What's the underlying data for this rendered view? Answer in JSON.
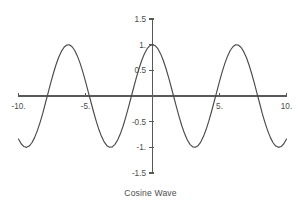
{
  "figure": {
    "caption": "Cosine Wave",
    "background_color": "#ffffff",
    "curve_color": "#4a4a4a",
    "axis_color": "#58595b",
    "text_color": "#4d4d4d"
  },
  "chart_data": {
    "type": "line",
    "title": "",
    "caption": "Cosine Wave",
    "function": "cos(x)",
    "xlabel": "",
    "ylabel": "",
    "xlim": [
      -10,
      10
    ],
    "ylim": [
      -1.5,
      1.5
    ],
    "grid": false,
    "legend": false,
    "axes_style": "crossing-at-origin",
    "x_ticks": [
      -10,
      -5,
      5,
      10
    ],
    "x_tick_labels": [
      "-10.",
      "-5.",
      "5.",
      "10."
    ],
    "y_ticks": [
      1.5,
      1,
      0.5,
      -0.5,
      -1,
      -1.5
    ],
    "y_tick_labels": [
      "1.5",
      "1.",
      "0.5",
      "-0.5",
      "-1.",
      "-1.5"
    ],
    "series": [
      {
        "name": "cos(x)",
        "color": "#4a4a4a",
        "x": [
          -10,
          -9.8,
          -9.6,
          -9.4,
          -9.2,
          -9,
          -8.8,
          -8.6,
          -8.4,
          -8.2,
          -8,
          -7.8,
          -7.6,
          -7.4,
          -7.2,
          -7,
          -6.8,
          -6.6,
          -6.4,
          -6.2,
          -6,
          -5.8,
          -5.6,
          -5.4,
          -5.2,
          -5,
          -4.8,
          -4.6,
          -4.4,
          -4.2,
          -4,
          -3.8,
          -3.6,
          -3.4,
          -3.2,
          -3,
          -2.8,
          -2.6,
          -2.4,
          -2.2,
          -2,
          -1.8,
          -1.6,
          -1.4,
          -1.2,
          -1,
          -0.8,
          -0.6,
          -0.4,
          -0.2,
          0,
          0.2,
          0.4,
          0.6,
          0.8,
          1,
          1.2,
          1.4,
          1.6,
          1.8,
          2,
          2.2,
          2.4,
          2.6,
          2.8,
          3,
          3.2,
          3.4,
          3.6,
          3.8,
          4,
          4.2,
          4.4,
          4.6,
          4.8,
          5,
          5.2,
          5.4,
          5.6,
          5.8,
          6,
          6.2,
          6.4,
          6.6,
          6.8,
          7,
          7.2,
          7.4,
          7.6,
          7.8,
          8,
          8.2,
          8.4,
          8.6,
          8.8,
          9,
          9.2,
          9.4,
          9.6,
          9.8,
          10
        ],
        "y": [
          -0.839,
          -0.93,
          -0.985,
          -1,
          -0.975,
          -0.911,
          -0.811,
          -0.679,
          -0.523,
          -0.349,
          -0.146,
          0.052,
          0.251,
          0.438,
          0.608,
          0.754,
          0.869,
          0.95,
          0.993,
          0.997,
          0.96,
          0.886,
          0.776,
          0.635,
          0.469,
          0.284,
          0.087,
          -0.112,
          -0.307,
          -0.49,
          -0.654,
          -0.791,
          -0.897,
          -0.967,
          -0.998,
          -0.99,
          -0.942,
          -0.857,
          -0.737,
          -0.589,
          -0.416,
          -0.227,
          -0.029,
          0.17,
          0.362,
          0.54,
          0.697,
          0.825,
          0.921,
          0.98,
          1,
          0.98,
          0.921,
          0.825,
          0.697,
          0.54,
          0.362,
          0.17,
          -0.029,
          -0.227,
          -0.416,
          -0.589,
          -0.737,
          -0.857,
          -0.942,
          -0.99,
          -0.998,
          -0.967,
          -0.897,
          -0.791,
          -0.654,
          -0.49,
          -0.307,
          -0.112,
          0.087,
          0.284,
          0.469,
          0.635,
          0.776,
          0.886,
          0.96,
          0.997,
          0.993,
          0.95,
          0.869,
          0.754,
          0.608,
          0.438,
          0.251,
          0.052,
          -0.146,
          -0.349,
          -0.523,
          -0.679,
          -0.811,
          -0.911,
          -0.975,
          -1,
          -0.985,
          -0.93,
          -0.839
        ]
      }
    ]
  }
}
